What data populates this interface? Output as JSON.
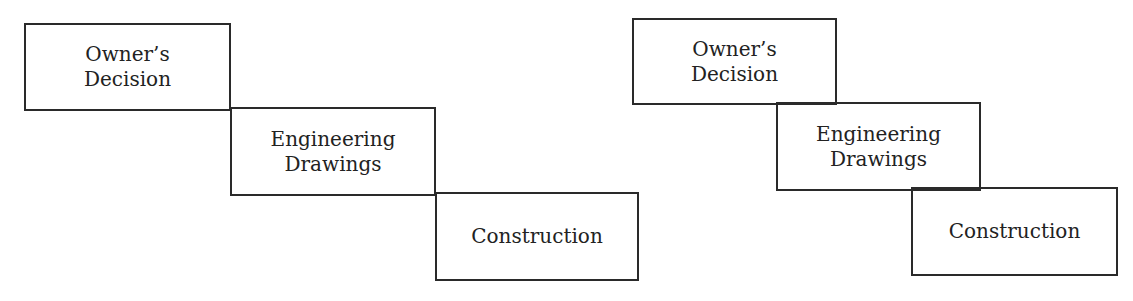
{
  "diagrams": [
    {
      "name": "sequential-process",
      "boxes": [
        {
          "line1": "Owner’s",
          "line2": "Decision",
          "x": 24,
          "y": 23,
          "w": 207,
          "h": 88
        },
        {
          "line1": "Engineering",
          "line2": "Drawings",
          "x": 230,
          "y": 107,
          "w": 206,
          "h": 89
        },
        {
          "line1": "Construction",
          "line2": "",
          "x": 435,
          "y": 192,
          "w": 204,
          "h": 89
        }
      ]
    },
    {
      "name": "overlapping-process",
      "boxes": [
        {
          "line1": "Owner’s",
          "line2": "Decision",
          "x": 632,
          "y": 18,
          "w": 205,
          "h": 87
        },
        {
          "line1": "Engineering",
          "line2": "Drawings",
          "x": 776,
          "y": 102,
          "w": 205,
          "h": 89
        },
        {
          "line1": "Construction",
          "line2": "",
          "x": 911,
          "y": 187,
          "w": 207,
          "h": 89
        }
      ]
    }
  ]
}
